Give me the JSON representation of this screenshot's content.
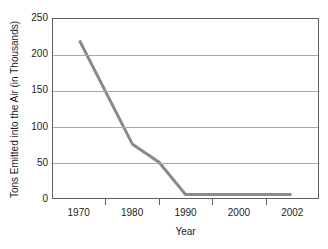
{
  "chart_data": {
    "type": "line",
    "title": "",
    "xlabel": "Year",
    "ylabel": "Tons Emitted into the Air (in Thousands)",
    "xlim": [
      1965,
      2005
    ],
    "ylim": [
      0,
      250
    ],
    "grid": true,
    "legend": false,
    "line_color": "#8a8a8a",
    "x_tick_labels": [
      "1970",
      "1980",
      "1990",
      "2000",
      "2002"
    ],
    "y_tick_labels": [
      "0",
      "50",
      "100",
      "150",
      "200",
      "250"
    ],
    "y_ticks": [
      0,
      50,
      100,
      150,
      200,
      250
    ],
    "series": [
      {
        "name": "Tons Emitted into the Air",
        "x": [
          1970,
          1980,
          1985,
          1990,
          2002
        ],
        "values": [
          220,
          75,
          50,
          5,
          5
        ]
      }
    ]
  },
  "axes": {
    "y_title": "Tons Emitted into the Air (in Thousands)",
    "x_title": "Year"
  }
}
